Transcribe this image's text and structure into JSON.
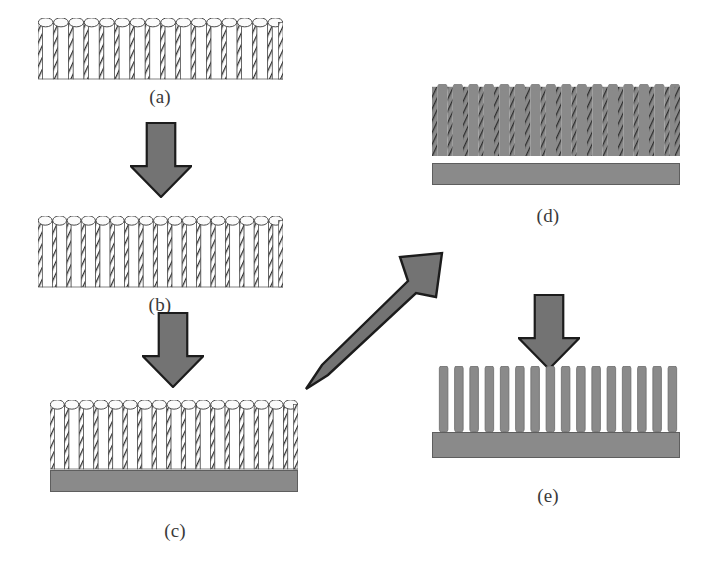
{
  "figure": {
    "background_color": "#ffffff",
    "width": 712,
    "height": 573
  },
  "colors": {
    "substrate_gray": "#8a8a8a",
    "substrate_outline": "#5e5e5e",
    "rod_fill_gray": "#8a8a8a",
    "rod_outline": "#6a6a6a",
    "arrow_fill": "#737373",
    "arrow_outline": "#1c1c1c",
    "tube_wall_hatch": "#2e2e2e",
    "tube_interior": "#ffffff",
    "tube_outline": "#4a4a4a",
    "label_text": "#3a3a3a"
  },
  "panels": [
    {
      "id": "a",
      "label": "(a)",
      "caption_semantic": "porous template with short wide tubes",
      "x": 38,
      "y": 18,
      "width": 245,
      "height": 62,
      "tube_count": 16,
      "has_substrate": false,
      "filled": false,
      "label_x": 160,
      "label_y": 86
    },
    {
      "id": "b",
      "label": "(b)",
      "caption_semantic": "stretched template with thin tall tubes",
      "x": 38,
      "y": 216,
      "width": 245,
      "height": 72,
      "tube_count": 17,
      "has_substrate": false,
      "filled": false,
      "label_x": 160,
      "label_y": 294
    },
    {
      "id": "c",
      "label": "(c)",
      "caption_semantic": "template bonded onto substrate",
      "x": 50,
      "y": 400,
      "width": 248,
      "height": 70,
      "tube_count": 17,
      "has_substrate": true,
      "substrate_x": 50,
      "substrate_y": 470,
      "substrate_width": 248,
      "substrate_height": 22,
      "filled": false,
      "label_x": 175,
      "label_y": 520
    },
    {
      "id": "d",
      "label": "(d)",
      "caption_semantic": "template pores filled with deposited material",
      "x": 432,
      "y": 84,
      "width": 248,
      "height": 72,
      "tube_count": 16,
      "has_substrate": true,
      "substrate_x": 432,
      "substrate_y": 163,
      "substrate_width": 248,
      "substrate_height": 22,
      "filled": true,
      "label_x": 548,
      "label_y": 205
    },
    {
      "id": "e",
      "label": "(e)",
      "caption_semantic": "freestanding nanorod array after template removal",
      "x": 436,
      "y": 366,
      "width": 244,
      "height": 66,
      "tube_count": 16,
      "has_substrate": true,
      "substrate_x": 432,
      "substrate_y": 432,
      "substrate_width": 248,
      "substrate_height": 26,
      "filled": true,
      "rods_only": true,
      "label_x": 548,
      "label_y": 485
    }
  ],
  "arrows": [
    {
      "id": "arrow-a-to-b",
      "direction": "down",
      "x": 130,
      "y": 122,
      "width": 62,
      "height": 76
    },
    {
      "id": "arrow-b-to-c",
      "direction": "down",
      "x": 142,
      "y": 312,
      "width": 62,
      "height": 76
    },
    {
      "id": "arrow-c-to-d",
      "direction": "up-right",
      "x": 300,
      "y": 243,
      "width": 152,
      "height": 152
    },
    {
      "id": "arrow-d-to-e",
      "direction": "down",
      "x": 518,
      "y": 294,
      "width": 62,
      "height": 76
    }
  ]
}
